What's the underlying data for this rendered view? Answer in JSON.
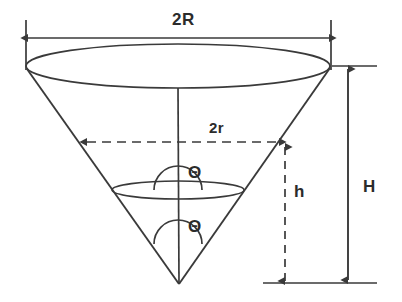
{
  "figure": {
    "type": "geometry-diagram",
    "background_color": "#ffffff",
    "stroke_color": "#3a3a3a",
    "text_color": "#2b2b2b"
  },
  "labels": {
    "top_diameter": "2R",
    "inner_diameter": "2r",
    "inner_height": "h",
    "total_height": "H",
    "angle_upper": "Θ",
    "angle_lower": "Θ"
  },
  "geometry": {
    "apex": {
      "x": 179,
      "y": 284
    },
    "top_ellipse": {
      "cx": 178,
      "cy": 66,
      "rx": 152,
      "ry": 22
    },
    "inner_ellipse": {
      "cx": 178,
      "cy": 190,
      "rx": 66,
      "ry": 9
    },
    "top_rim_left": {
      "x": 27,
      "y": 70
    },
    "top_rim_right": {
      "x": 330,
      "y": 68
    },
    "axis": {
      "x": 178,
      "y_top": 88,
      "y_bottom": 284
    },
    "dimension_2R": {
      "y": 38,
      "x_left": 26,
      "x_right": 331
    },
    "dimension_2r": {
      "y": 142,
      "x_left": 85,
      "x_right": 281,
      "style": "dashed"
    },
    "dimension_h": {
      "x": 285,
      "y_top": 145,
      "y_bottom": 283,
      "style": "dashed"
    },
    "dimension_H": {
      "x": 348,
      "y_top": 67,
      "y_bottom": 281,
      "style": "solid"
    },
    "baseline": {
      "y": 283,
      "x_left": 263,
      "x_right": 376
    },
    "top_reference_line": {
      "y": 66,
      "x_left": 332,
      "x_right": 376
    }
  }
}
